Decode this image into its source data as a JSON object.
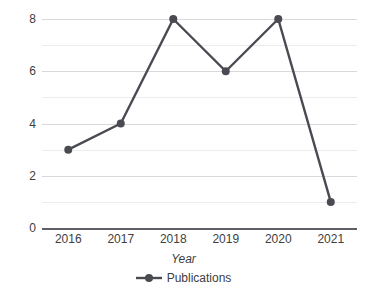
{
  "chart_data": {
    "type": "line",
    "title": "",
    "subtitle": "",
    "xlabel": "Year",
    "ylabel": "",
    "categories": [
      "2016",
      "2017",
      "2018",
      "2019",
      "2020",
      "2021"
    ],
    "series": [
      {
        "name": "Publications",
        "values": [
          3,
          4,
          8,
          6,
          8,
          1
        ]
      }
    ],
    "ylim": [
      0,
      8
    ],
    "y_ticks": [
      "8",
      "6",
      "4",
      "2",
      "0"
    ],
    "y_tick_values": [
      8,
      6,
      4,
      2,
      0
    ],
    "gridlines": {
      "major_values": [
        2,
        4,
        6,
        8
      ],
      "minor_values": [
        1,
        3,
        5,
        7
      ],
      "orientation": "horizontal",
      "visible": true
    },
    "legend": {
      "position": "bottom",
      "entries": [
        {
          "label": "Publications",
          "marker": "circle",
          "color": "#4a4a52"
        }
      ]
    },
    "colors": {
      "series": "#4a4a52",
      "marker": "#4a4a52",
      "gridline_major": "#d9d9dd",
      "gridline_minor": "#ececf0",
      "axis": "#5f5f67",
      "text": "#404040",
      "background": "#ffffff"
    },
    "marker_radius": 4,
    "line_width": 2.4
  }
}
